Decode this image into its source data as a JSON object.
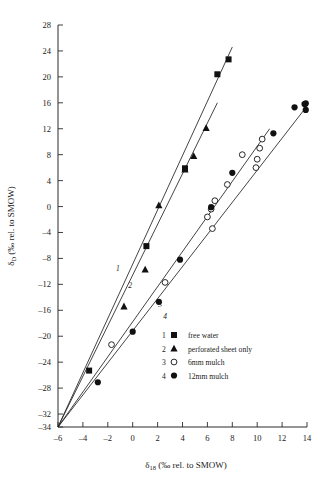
{
  "figure": {
    "name": "isotope-regression-plot",
    "background": "#ffffff",
    "ink": "#111111"
  },
  "chart_data": {
    "type": "scatter",
    "title": "",
    "xlabel": "δ₁₈ (‰ rel. to SMOW)",
    "ylabel": "δᴅ (‰ rel. to SMOW)",
    "xlabel_parts": {
      "symbol": "δ",
      "subscript": "18",
      "rest": " (‰ rel. to SMOW)"
    },
    "ylabel_parts": {
      "symbol": "δ",
      "subscript": "D",
      "rest": " (‰ rel. to SMOW)"
    },
    "xlim": [
      -6,
      14
    ],
    "ylim": [
      -34,
      28
    ],
    "xticks": [
      -6,
      -4,
      -2,
      0,
      2,
      4,
      6,
      8,
      10,
      12,
      14
    ],
    "xtick_labels": [
      "–6",
      "–4",
      "–2",
      "0",
      "2",
      "4",
      "6",
      "8",
      "10",
      "12",
      "14"
    ],
    "yticks": [
      -34,
      -32,
      -28,
      -24,
      -20,
      -16,
      -12,
      -8,
      -4,
      0,
      4,
      8,
      12,
      16,
      20,
      24,
      28
    ],
    "ytick_labels": [
      "–34",
      "–32",
      "–28",
      "–24",
      "–20",
      "–16",
      "–12",
      "–8",
      "–4",
      "0",
      "4",
      "8",
      "12",
      "16",
      "20",
      "24",
      "28"
    ],
    "grid": false,
    "legend_position": "lower-right-inside",
    "common_intercept_point": [
      -6.0,
      -34.0
    ],
    "series": [
      {
        "id": 1,
        "name": "free water",
        "marker": "filled-square",
        "line_label": "1",
        "line": {
          "x1": -6.0,
          "y1": -34.0,
          "x2": 8.0,
          "y2": 24.6
        },
        "points": [
          {
            "x": -3.5,
            "y": -25.3
          },
          {
            "x": 1.1,
            "y": -6.1
          },
          {
            "x": 4.2,
            "y": 5.9
          },
          {
            "x": 6.8,
            "y": 20.4
          },
          {
            "x": 7.7,
            "y": 22.7
          }
        ]
      },
      {
        "id": 2,
        "name": "perforated sheet only",
        "marker": "filled-triangle",
        "line_label": "2",
        "line": {
          "x1": -6.0,
          "y1": -34.0,
          "x2": 6.8,
          "y2": 16.0
        },
        "points": [
          {
            "x": -0.7,
            "y": -15.4
          },
          {
            "x": 1.0,
            "y": -9.7
          },
          {
            "x": 2.1,
            "y": 0.2
          },
          {
            "x": 4.2,
            "y": 5.7
          },
          {
            "x": 4.9,
            "y": 7.8
          },
          {
            "x": 5.9,
            "y": 12.1
          }
        ]
      },
      {
        "id": 3,
        "name": "6mm mulch",
        "marker": "open-circle",
        "line_label": "3",
        "line": {
          "x1": -6.0,
          "y1": -34.0,
          "x2": 11.0,
          "y2": 12.0
        },
        "points": [
          {
            "x": -1.7,
            "y": -21.3
          },
          {
            "x": 2.6,
            "y": -11.7
          },
          {
            "x": 6.0,
            "y": -1.6
          },
          {
            "x": 6.3,
            "y": -0.4
          },
          {
            "x": 6.4,
            "y": -3.4
          },
          {
            "x": 6.6,
            "y": 0.9
          },
          {
            "x": 7.6,
            "y": 3.4
          },
          {
            "x": 8.8,
            "y": 8.0
          },
          {
            "x": 9.9,
            "y": 6.0
          },
          {
            "x": 10.0,
            "y": 7.3
          },
          {
            "x": 10.2,
            "y": 9.0
          },
          {
            "x": 10.4,
            "y": 10.4
          }
        ]
      },
      {
        "id": 4,
        "name": "12mm mulch",
        "marker": "filled-circle",
        "line_label": "4",
        "line": {
          "x1": -6.0,
          "y1": -34.0,
          "x2": 14.0,
          "y2": 15.5
        },
        "points": [
          {
            "x": -2.8,
            "y": -27.1
          },
          {
            "x": 0.0,
            "y": -19.3
          },
          {
            "x": 2.1,
            "y": -14.7
          },
          {
            "x": 3.8,
            "y": -8.2
          },
          {
            "x": 6.3,
            "y": -0.1
          },
          {
            "x": 8.0,
            "y": 5.2
          },
          {
            "x": 11.3,
            "y": 11.3
          },
          {
            "x": 13.0,
            "y": 15.3
          },
          {
            "x": 13.8,
            "y": 15.8
          },
          {
            "x": 13.9,
            "y": 14.9
          },
          {
            "x": 13.9,
            "y": 15.9
          }
        ]
      }
    ],
    "line_number_annotations": [
      {
        "label": "1",
        "x": -1.2,
        "y": -10.0
      },
      {
        "label": "2",
        "x": -0.2,
        "y": -12.5
      },
      {
        "label": "3",
        "x": 2.2,
        "y": -15.5
      },
      {
        "label": "4",
        "x": 2.6,
        "y": -17.4
      }
    ]
  },
  "legend": {
    "name": "series-legend",
    "entries": [
      {
        "num": "1",
        "marker": "filled-square",
        "label": "free water"
      },
      {
        "num": "2",
        "marker": "filled-triangle",
        "label": "perforated sheet only"
      },
      {
        "num": "3",
        "marker": "open-circle",
        "label": "6mm mulch"
      },
      {
        "num": "4",
        "marker": "filled-circle",
        "label": "12mm mulch"
      }
    ]
  }
}
